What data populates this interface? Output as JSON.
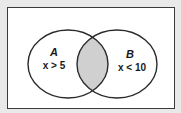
{
  "diagram": {
    "type": "venn",
    "colors": {
      "background": "#e9e9e9",
      "frame": "#ffffff",
      "stroke": "#2a2a2a",
      "intersection_fill": "#d0d0d0"
    },
    "sets": [
      {
        "name": "A",
        "condition": "x > 5"
      },
      {
        "name": "B",
        "condition": "x < 10"
      }
    ],
    "shaded_region": "A ∩ B"
  }
}
